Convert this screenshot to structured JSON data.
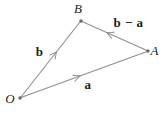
{
  "labels": {
    "vertex_o": "O",
    "vertex_a": "A",
    "vertex_b": "B",
    "vector_b": "b",
    "vector_a": "a",
    "vector_b_minus_a": "b − a"
  },
  "colors": {
    "line": "#8e8e8e",
    "dot": "#6a6a6a",
    "text": "#1c1c1c",
    "background": "#ffffff"
  }
}
